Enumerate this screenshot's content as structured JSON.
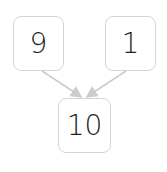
{
  "diagram": {
    "type": "number-bond",
    "parts": [
      {
        "label": "9"
      },
      {
        "label": "1"
      }
    ],
    "whole": {
      "label": "10"
    },
    "colors": {
      "box_border": "#d4d4d4",
      "arrow": "#cccccc",
      "text": "#222222"
    }
  }
}
